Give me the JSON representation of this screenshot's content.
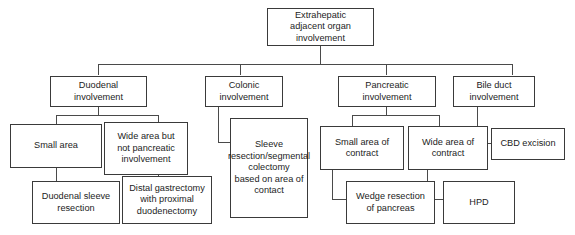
{
  "diagram": {
    "title": "Extrahepatic adjacent organ involvement",
    "type": "flowchart",
    "orientation": "top-down",
    "nodes": {
      "root": {
        "label": "Extrahepatic\nadjacent organ\ninvolvement"
      },
      "duodenal": {
        "label": "Duodenal\ninvolvement"
      },
      "colonic": {
        "label": "Colonic\ninvolvement"
      },
      "pancreatic": {
        "label": "Pancreatic\ninvolvement"
      },
      "bile_duct": {
        "label": "Bile duct\ninvolvement"
      },
      "small_area": {
        "label": "Small area"
      },
      "wide_area_not_pancreatic": {
        "label": "Wide area but\nnot pancreatic\ninvolvement"
      },
      "sleeve_resection": {
        "label": "Sleeve\nresection/segmental\ncolectomy\nbased on area of\ncontact"
      },
      "small_area_contract": {
        "label": "Small area of\ncontract"
      },
      "wide_area_contract": {
        "label": "Wide area of\ncontract"
      },
      "cbd_excision": {
        "label": "CBD excision"
      },
      "duodenal_sleeve_resection": {
        "label": "Duodenal sleeve\nresection"
      },
      "distal_gastrectomy": {
        "label": "Distal gastrectomy\nwith proximal\nduodenectomy"
      },
      "wedge_resection": {
        "label": "Wedge resection\nof pancreas"
      },
      "hpd": {
        "label": "HPD"
      }
    },
    "edges": [
      {
        "from": "root",
        "to": "duodenal"
      },
      {
        "from": "root",
        "to": "colonic"
      },
      {
        "from": "root",
        "to": "pancreatic"
      },
      {
        "from": "root",
        "to": "bile_duct"
      },
      {
        "from": "duodenal",
        "to": "small_area"
      },
      {
        "from": "duodenal",
        "to": "wide_area_not_pancreatic"
      },
      {
        "from": "colonic",
        "to": "sleeve_resection"
      },
      {
        "from": "pancreatic",
        "to": "small_area_contract"
      },
      {
        "from": "pancreatic",
        "to": "wide_area_contract"
      },
      {
        "from": "bile_duct",
        "to": "cbd_excision"
      },
      {
        "from": "small_area",
        "to": "duodenal_sleeve_resection"
      },
      {
        "from": "wide_area_not_pancreatic",
        "to": "distal_gastrectomy"
      },
      {
        "from": "small_area_contract",
        "to": "wedge_resection"
      },
      {
        "from": "wide_area_contract",
        "to": "hpd"
      }
    ],
    "colors": {
      "box_border": "#3a3a3a",
      "connector": "#4a4a4a",
      "text": "#1c1c1c",
      "background": "#ffffff"
    }
  }
}
